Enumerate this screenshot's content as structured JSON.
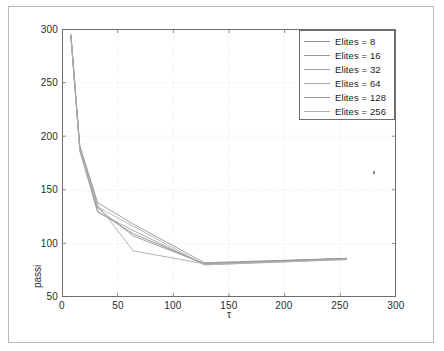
{
  "figure": {
    "background": "#ffffff",
    "frame_color": "#b9b9b9",
    "axis_color": "#6e6e6e",
    "grid_color": "#d8d8d8",
    "speck_name": "stray-pixel-artifact"
  },
  "chart_data": {
    "type": "line",
    "title": "",
    "xlabel": "τ",
    "ylabel": "passi",
    "xlim": [
      0,
      300
    ],
    "ylim": [
      50,
      300
    ],
    "xticks": [
      0,
      50,
      100,
      150,
      200,
      250,
      300
    ],
    "yticks": [
      50,
      100,
      150,
      200,
      250,
      300
    ],
    "grid": true,
    "grid_style": "dotted",
    "legend_position": "upper right",
    "x": [
      8,
      16,
      32,
      64,
      128,
      256
    ],
    "series": [
      {
        "name": "Elites = 8",
        "color": "#8f8f8f",
        "values": [
          295,
          190,
          130,
          109,
          81,
          86
        ]
      },
      {
        "name": "Elites = 16",
        "color": "#9a9a9a",
        "values": [
          293,
          188,
          133,
          107,
          81,
          86
        ]
      },
      {
        "name": "Elites = 32",
        "color": "#a0a0a0",
        "values": [
          294,
          186,
          129,
          112,
          80,
          85
        ]
      },
      {
        "name": "Elites = 64",
        "color": "#aaaaaa",
        "values": [
          292,
          189,
          136,
          93,
          81,
          86
        ]
      },
      {
        "name": "Elites = 128",
        "color": "#949494",
        "values": [
          295,
          191,
          138,
          118,
          82,
          86
        ]
      },
      {
        "name": "Elites = 256",
        "color": "#b0b0b0",
        "values": [
          294,
          187,
          134,
          116,
          80,
          85
        ]
      }
    ]
  },
  "axes": {
    "ytick_labels": [
      "300",
      "250",
      "200",
      "150",
      "100",
      "50"
    ],
    "xtick_labels": [
      "0",
      "50",
      "100",
      "150",
      "200",
      "250",
      "300"
    ],
    "ylabel_text": "passi",
    "xlabel_text": "τ"
  },
  "legend": {
    "entries": [
      {
        "label": "Elites = 8"
      },
      {
        "label": "Elites = 16"
      },
      {
        "label": "Elites = 32"
      },
      {
        "label": "Elites = 64"
      },
      {
        "label": "Elites = 128"
      },
      {
        "label": "Elites = 256"
      }
    ]
  }
}
